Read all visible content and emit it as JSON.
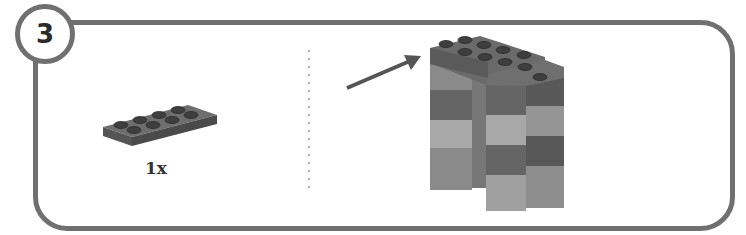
{
  "step": {
    "number": "3"
  },
  "parts_list": [
    {
      "part": "plate 2x4",
      "quantity_label": "1x",
      "color": "#5c5c5c"
    }
  ],
  "assembly": {
    "arrow_target": "top plate 2x4",
    "layers_left_column": [
      "#8a8a8a",
      "#656565",
      "#a8a8a8",
      "#8a8a8a"
    ],
    "layers_right_column": [
      "#656565",
      "#a8a8a8",
      "#656565",
      "#a0a0a0"
    ]
  },
  "colors": {
    "frame": "#707070",
    "divider": "#b0b0b0",
    "arrow": "#555555"
  }
}
